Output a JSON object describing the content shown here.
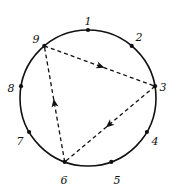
{
  "figure": {
    "background_color": "#ffffff",
    "stroke_color": "#111111"
  },
  "circle": {
    "center_x": 88,
    "center_y": 98,
    "radius": 68,
    "stroke_color": "#111111",
    "stroke_width": 1.6,
    "fill": "none"
  },
  "points": [
    {
      "label": "1",
      "angle_deg": -90,
      "x": 88,
      "y": 30,
      "label_x": 88,
      "label_y": 22,
      "dot": true
    },
    {
      "label": "2",
      "angle_deg": -50,
      "x": 131.7,
      "y": 45.9,
      "label_x": 139,
      "label_y": 38,
      "dot": true
    },
    {
      "label": "3",
      "angle_deg": -10,
      "x": 155.0,
      "y": 86.2,
      "label_x": 163,
      "label_y": 88,
      "dot": true
    },
    {
      "label": "4",
      "angle_deg": 30,
      "x": 146.9,
      "y": 132.0,
      "label_x": 155,
      "label_y": 142,
      "dot": true
    },
    {
      "label": "5",
      "angle_deg": 70,
      "x": 111.3,
      "y": 161.9,
      "label_x": 117,
      "label_y": 181,
      "dot": true
    },
    {
      "label": "6",
      "angle_deg": 110,
      "x": 64.7,
      "y": 161.9,
      "label_x": 64,
      "label_y": 181,
      "dot": true
    },
    {
      "label": "7",
      "angle_deg": 150,
      "x": 29.1,
      "y": 132.0,
      "label_x": 20,
      "label_y": 142,
      "dot": true
    },
    {
      "label": "8",
      "angle_deg": 190,
      "x": 21.0,
      "y": 86.2,
      "label_x": 11,
      "label_y": 89,
      "dot": true
    },
    {
      "label": "9",
      "angle_deg": 230,
      "x": 44.3,
      "y": 45.9,
      "label_x": 36,
      "label_y": 40,
      "dot": true
    }
  ],
  "edges": [
    {
      "id": "edge-9-3",
      "from": "9",
      "to": "3",
      "style": "dashed",
      "arrow_at": 0.5,
      "arrow_direction": "toward-3"
    },
    {
      "id": "edge-3-6",
      "from": "3",
      "to": "6",
      "style": "dashed",
      "arrow_at": 0.5,
      "arrow_direction": "toward-6"
    },
    {
      "id": "edge-6-9",
      "from": "6",
      "to": "9",
      "style": "dashed",
      "arrow_at": 0.5,
      "arrow_direction": "toward-9"
    }
  ],
  "edge_style": {
    "stroke_color": "#111111",
    "stroke_width": 1.3,
    "dash_pattern": "4 3"
  },
  "dot_style": {
    "radius": 2.1,
    "fill": "#111111"
  },
  "arrow_style": {
    "fill": "#111111",
    "size": 7
  }
}
